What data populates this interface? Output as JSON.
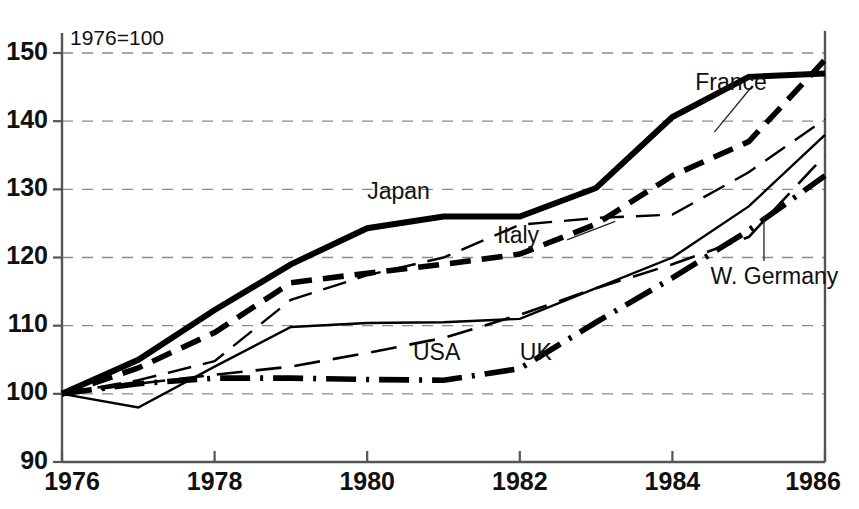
{
  "chart_data": {
    "type": "line",
    "title": "",
    "subtitle": "",
    "annotation": "1976=100",
    "xlabel": "",
    "ylabel": "",
    "xlim": [
      1976,
      1986
    ],
    "ylim": [
      90,
      150
    ],
    "grid": true,
    "legend_position": "inline-labels",
    "x": [
      1976,
      1977,
      1978,
      1979,
      1980,
      1981,
      1982,
      1983,
      1984,
      1985,
      1986
    ],
    "xticks": [
      "1976",
      "1978",
      "1980",
      "1982",
      "1984",
      "1986"
    ],
    "xtick_values": [
      1976,
      1978,
      1980,
      1982,
      1984,
      1986
    ],
    "yticks": [
      "90",
      "100",
      "110",
      "120",
      "130",
      "140",
      "150"
    ],
    "ytick_values": [
      90,
      100,
      110,
      120,
      130,
      140,
      150
    ],
    "series": [
      {
        "name": "Japan",
        "label": "Japan",
        "style": "thick-solid",
        "values": [
          100.0,
          105.0,
          112.3,
          119.0,
          124.3,
          126.0,
          126.0,
          130.2,
          140.6,
          146.5,
          147.0
        ],
        "label_x": 1980.0,
        "label_y": 129.5
      },
      {
        "name": "Italy",
        "label": "Italy",
        "style": "thick-dashed",
        "values": [
          100.0,
          103.8,
          109.0,
          116.3,
          117.7,
          119.0,
          120.5,
          124.9,
          132.0,
          137.0,
          149.0
        ],
        "label_x": 1981.7,
        "label_y": 123.0
      },
      {
        "name": "France",
        "label": "France",
        "style": "thin-dashed",
        "values": [
          100.0,
          102.0,
          104.8,
          113.8,
          117.4,
          120.0,
          124.8,
          125.8,
          126.3,
          132.5,
          140.3
        ],
        "label_x": 1984.3,
        "label_y": 145.5
      },
      {
        "name": "USA",
        "label": "USA",
        "style": "thin-solid",
        "values": [
          100.0,
          98.0,
          104.0,
          109.8,
          110.4,
          110.5,
          111.0,
          115.5,
          120.0,
          127.5,
          138.0
        ],
        "label_x": 1980.6,
        "label_y": 105.8
      },
      {
        "name": "W. Germany",
        "label": "W. Germany",
        "style": "medium-dashed",
        "values": [
          100.0,
          101.5,
          102.8,
          104.0,
          106.0,
          108.2,
          111.6,
          115.5,
          119.0,
          123.0,
          135.0
        ],
        "label_x": 1984.5,
        "label_y": 117.0
      },
      {
        "name": "UK",
        "label": "UK",
        "style": "thick-dashdot",
        "values": [
          100.0,
          101.5,
          102.3,
          102.3,
          102.1,
          102.0,
          103.7,
          110.5,
          117.0,
          124.0,
          132.0
        ],
        "label_x": 1982.0,
        "label_y": 105.8
      }
    ]
  },
  "colors": {
    "ink": "#000000",
    "axis": "#555555",
    "grid": "#8a8a8a",
    "background": "#ffffff"
  }
}
